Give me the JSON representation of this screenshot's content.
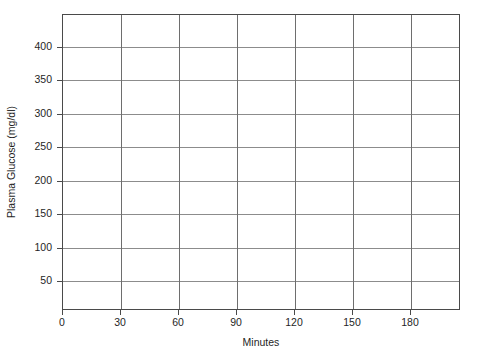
{
  "chart_data": {
    "type": "line",
    "title": "",
    "subtitle": "",
    "xlabel": "Minutes",
    "ylabel": "Plasma Glucose (mg/dl)",
    "x": [
      0,
      30,
      60,
      90,
      120,
      150,
      180
    ],
    "xtick_labels": [
      "0",
      "30",
      "60",
      "90",
      "120",
      "150",
      "180"
    ],
    "ytick_labels": [
      "50",
      "100",
      "150",
      "200",
      "250",
      "300",
      "350",
      "400"
    ],
    "yticks": [
      50,
      100,
      150,
      200,
      250,
      300,
      350,
      400
    ],
    "xlim": [
      0,
      210
    ],
    "ylim": [
      0,
      430
    ],
    "grid": true,
    "grid_axis": "both",
    "legend": false,
    "legend_position": "none",
    "series": [],
    "annotations": [],
    "note": "Empty plotting grid — no data series are drawn in the axes.",
    "colors": {
      "axis": "#4a4a4a",
      "grid_horizontal": "#8c8c8c",
      "grid_vertical": "#6e6e6e",
      "text": "#1f1f1f",
      "background": "#ffffff"
    }
  }
}
